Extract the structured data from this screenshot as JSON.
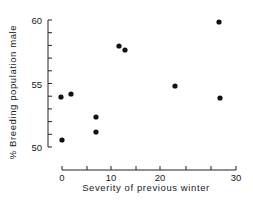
{
  "chart_data": {
    "type": "scatter",
    "title": "",
    "xlabel": "Severity of previous winter",
    "ylabel": "% Breeding population male",
    "xlim": [
      0,
      30
    ],
    "ylim": [
      50,
      60
    ],
    "grid": false,
    "legend": null,
    "x_ticks": [
      0,
      10,
      20,
      30
    ],
    "y_ticks": [
      50,
      55,
      60
    ],
    "x_minor_ticks": [
      0,
      5,
      10,
      15,
      20,
      25,
      27.5,
      30
    ],
    "y_minor_ticks": [
      50,
      51,
      52,
      53,
      54,
      55,
      56,
      57,
      58,
      59,
      60
    ],
    "points": [
      {
        "x": 0,
        "y": 54.0
      },
      {
        "x": 1.8,
        "y": 54.2
      },
      {
        "x": 7,
        "y": 52.4
      },
      {
        "x": 7,
        "y": 51.2
      },
      {
        "x": 0,
        "y": 50.6
      },
      {
        "x": 11.6,
        "y": 58.0
      },
      {
        "x": 12.8,
        "y": 57.7
      },
      {
        "x": 23,
        "y": 54.9
      },
      {
        "x": 28,
        "y": 59.9
      },
      {
        "x": 28,
        "y": 53.9
      }
    ],
    "marker_color": "#111111"
  },
  "layout": {
    "y_axis_x": 48,
    "y_top": 20,
    "y_bottom": 147,
    "x_axis_y": 170,
    "x_ticks_px": [
      62,
      87,
      111,
      136,
      160,
      186,
      211,
      236
    ],
    "x_tick_labels": [
      {
        "text": "0",
        "px": 62
      },
      {
        "text": "10",
        "px": 111
      },
      {
        "text": "20",
        "px": 160
      },
      {
        "text": "30",
        "px": 236
      }
    ],
    "y_tick_labels": [
      {
        "text": "60",
        "py": 20
      },
      {
        "text": "55",
        "py": 84
      },
      {
        "text": "50",
        "py": 147
      }
    ],
    "points_px": [
      [
        61,
        97
      ],
      [
        71,
        94
      ],
      [
        96,
        117
      ],
      [
        96,
        132
      ],
      [
        62,
        140
      ],
      [
        119,
        46
      ],
      [
        125,
        50
      ],
      [
        175,
        86
      ],
      [
        219,
        22
      ],
      [
        220,
        98
      ]
    ]
  }
}
